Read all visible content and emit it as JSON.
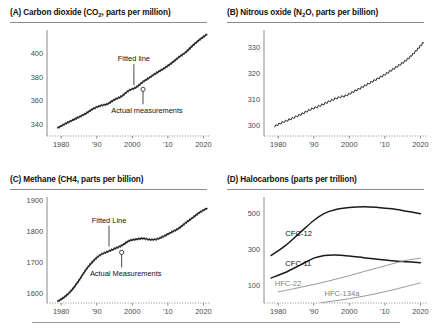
{
  "figure": {
    "background": "#ffffff",
    "line_color": "#1a1a1a",
    "gray_line_color": "#8c8c8c",
    "axis_color": "#8a8a8a"
  },
  "panels": [
    {
      "id": "panel-a",
      "title_prefix": "(A) Carbon dioxide (CO",
      "title_sub": "2",
      "title_suffix": ", parts per million)",
      "title_plain": "(A) Carbon dioxide (CO2, parts per million)",
      "annotations": [
        {
          "name": "fitted-line",
          "text": "Fitted line"
        },
        {
          "name": "actual-measurements",
          "text": "Actual measurements"
        }
      ]
    },
    {
      "id": "panel-b",
      "title_prefix": "(B) Nitrous oxide (N",
      "title_sub": "2",
      "title_suffix": "O, parts per billion)",
      "title_plain": "(B) Nitrous oxide (N2O, parts per billion)",
      "annotations": []
    },
    {
      "id": "panel-c",
      "title_prefix": "(C) Methane (CH4, parts per billion)",
      "title_sub": "",
      "title_suffix": "",
      "title_plain": "(C) Methane (CH4, parts per billion)",
      "annotations": [
        {
          "name": "fitted-line",
          "text": "Fitted Line"
        },
        {
          "name": "actual-measurements",
          "text": "Actual Measurements"
        }
      ]
    },
    {
      "id": "panel-d",
      "title_prefix": "(D) Halocarbons (parts per trillion)",
      "title_sub": "",
      "title_suffix": "",
      "title_plain": "(D) Halocarbons (parts per trillion)",
      "annotations": []
    }
  ],
  "chart_data": [
    {
      "type": "line",
      "panel": "A",
      "title": "(A) Carbon dioxide (CO2, parts per million)",
      "xlabel": "",
      "ylabel": "parts per million",
      "xlim": [
        1976,
        2021
      ],
      "ylim": [
        330,
        418
      ],
      "yticks": [
        340,
        360,
        380,
        400
      ],
      "xticks": [
        1980,
        1990,
        2000,
        2010,
        2020
      ],
      "xtick_labels": [
        "1980",
        "'90",
        "2000",
        "'10",
        "2020"
      ],
      "grid": false,
      "legend": "none",
      "series": [
        {
          "name": "Fitted line",
          "x": [
            1979,
            1981,
            1983,
            1985,
            1987,
            1989,
            1991,
            1993,
            1995,
            1997,
            1999,
            2001,
            2003,
            2005,
            2007,
            2009,
            2011,
            2013,
            2015,
            2017,
            2019,
            2021
          ],
          "values": [
            336.8,
            340.1,
            343.1,
            346.0,
            349.2,
            353.1,
            355.6,
            357.1,
            360.8,
            363.7,
            368.4,
            371.1,
            375.8,
            379.8,
            383.8,
            387.4,
            391.6,
            396.5,
            400.8,
            406.6,
            411.7,
            416.0
          ]
        }
      ]
    },
    {
      "type": "line",
      "panel": "B",
      "title": "(B) Nitrous oxide (N2O, parts per billion)",
      "xlabel": "",
      "ylabel": "parts per billion",
      "xlim": [
        1976,
        2021
      ],
      "ylim": [
        296,
        336
      ],
      "yticks": [
        300,
        310,
        320,
        330
      ],
      "xticks": [
        1980,
        1990,
        2000,
        2010,
        2020
      ],
      "xtick_labels": [
        "1980",
        "'90",
        "2000",
        "'10",
        "2020"
      ],
      "grid": false,
      "legend": "none",
      "series": [
        {
          "name": "N2O",
          "x": [
            1979,
            1981,
            1983,
            1985,
            1987,
            1989,
            1991,
            1993,
            1995,
            1997,
            1999,
            2001,
            2003,
            2005,
            2007,
            2009,
            2011,
            2013,
            2015,
            2017,
            2019,
            2021
          ],
          "values": [
            299.8,
            301.2,
            302.3,
            303.5,
            304.8,
            306.2,
            307.3,
            308.5,
            309.8,
            310.9,
            311.6,
            313.0,
            314.4,
            315.9,
            317.4,
            318.9,
            320.6,
            322.4,
            324.2,
            326.4,
            329.2,
            332.3
          ]
        }
      ]
    },
    {
      "type": "line",
      "panel": "C",
      "title": "(C) Methane (CH4, parts per billion)",
      "xlabel": "",
      "ylabel": "parts per billion",
      "xlim": [
        1976,
        2021
      ],
      "ylim": [
        1570,
        1905
      ],
      "yticks": [
        1600,
        1700,
        1800,
        1900
      ],
      "xticks": [
        1980,
        1990,
        2000,
        2010,
        2020
      ],
      "xtick_labels": [
        "1980",
        "'90",
        "2000",
        "'10",
        "2020"
      ],
      "grid": false,
      "legend": "none",
      "series": [
        {
          "name": "Fitted Line",
          "x": [
            1979,
            1981,
            1983,
            1985,
            1987,
            1989,
            1991,
            1993,
            1995,
            1997,
            1999,
            2001,
            2003,
            2005,
            2007,
            2009,
            2011,
            2013,
            2015,
            2017,
            2019,
            2021
          ],
          "values": [
            1575,
            1590,
            1612,
            1643,
            1678,
            1705,
            1725,
            1735,
            1745,
            1755,
            1770,
            1775,
            1778,
            1774,
            1776,
            1786,
            1798,
            1810,
            1828,
            1845,
            1862,
            1875
          ]
        }
      ]
    },
    {
      "type": "line",
      "panel": "D",
      "title": "(D) Halocarbons (parts per trillion)",
      "xlabel": "",
      "ylabel": "parts per trillion",
      "xlim": [
        1976,
        2021
      ],
      "ylim": [
        0,
        580
      ],
      "yticks": [
        100,
        300,
        500
      ],
      "xticks": [
        1980,
        1990,
        2000,
        2010,
        2020
      ],
      "xtick_labels": [
        "1980",
        "'90",
        "2000",
        "'10",
        "2020"
      ],
      "grid": false,
      "legend": "inline-labels",
      "series": [
        {
          "name": "CFC-12",
          "color": "#1a1a1a",
          "label_x": 1982,
          "label_y": 375,
          "x": [
            1978,
            1982,
            1986,
            1990,
            1993,
            1996,
            2000,
            2004,
            2008,
            2012,
            2016,
            2020
          ],
          "values": [
            265,
            320,
            390,
            460,
            500,
            520,
            532,
            537,
            533,
            525,
            512,
            498
          ]
        },
        {
          "name": "CFC-11",
          "color": "#1a1a1a",
          "label_x": 1982,
          "label_y": 205,
          "x": [
            1978,
            1982,
            1986,
            1990,
            1993,
            1996,
            2000,
            2004,
            2008,
            2012,
            2016,
            2020
          ],
          "values": [
            140,
            170,
            210,
            250,
            265,
            268,
            262,
            253,
            244,
            236,
            230,
            225
          ]
        },
        {
          "name": "HFC-22",
          "color": "#8c8c8c",
          "label_x": 1979,
          "label_y": 95,
          "x": [
            1980,
            1984,
            1988,
            1992,
            1996,
            2000,
            2004,
            2008,
            2012,
            2016,
            2020
          ],
          "values": [
            62,
            78,
            95,
            112,
            132,
            152,
            175,
            196,
            218,
            238,
            250
          ]
        },
        {
          "name": "HFC-134a",
          "color": "#8c8c8c",
          "label_x": 1993,
          "label_y": 38,
          "x": [
            1992,
            1996,
            2000,
            2004,
            2008,
            2012,
            2016,
            2020
          ],
          "values": [
            2,
            12,
            24,
            38,
            54,
            72,
            92,
            112
          ]
        }
      ]
    }
  ]
}
